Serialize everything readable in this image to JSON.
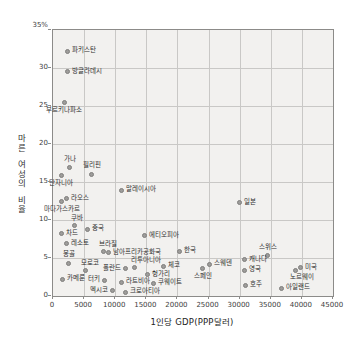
{
  "chart_data": {
    "type": "scatter",
    "title": "",
    "xlabel": "1인당 GDP(PPP달러)",
    "ylabel": "마른 여성의 비율",
    "ylabel_vertical_groups": [
      "마른",
      "여성의",
      "비율"
    ],
    "xlim": [
      0,
      45000
    ],
    "ylim": [
      0,
      35
    ],
    "grid": true,
    "x_grid_step": 5000,
    "y_grid_step": 5,
    "x_ticks": [
      {
        "value": 0,
        "label": "0"
      },
      {
        "value": 5000,
        "label": "5000"
      },
      {
        "value": 10000,
        "label": "10000"
      },
      {
        "value": 15000,
        "label": "15000"
      },
      {
        "value": 20000,
        "label": "20000"
      },
      {
        "value": 25000,
        "label": "25000"
      },
      {
        "value": 30000,
        "label": "30000"
      },
      {
        "value": 35000,
        "label": "35000"
      },
      {
        "value": 40000,
        "label": "40000"
      },
      {
        "value": 45000,
        "label": "45000"
      }
    ],
    "y_ticks": [
      {
        "value": 0,
        "label": "0",
        "dy": 0
      },
      {
        "value": 5,
        "label": "5",
        "dy": 0
      },
      {
        "value": 10,
        "label": "10",
        "dy": 0
      },
      {
        "value": 15,
        "label": "15",
        "dy": 0
      },
      {
        "value": 20,
        "label": "20",
        "dy": 0
      },
      {
        "value": 25,
        "label": "25",
        "dy": 0
      },
      {
        "value": 30,
        "label": "30",
        "dy": 0
      },
      {
        "value": 35,
        "label": "35%",
        "dy": -4
      }
    ],
    "points": [
      {
        "label": "파키스탄",
        "x": 2300,
        "y": 32.2,
        "pos": "right"
      },
      {
        "label": "방글라데시",
        "x": 2300,
        "y": 29.5,
        "pos": "right"
      },
      {
        "label": "부르키나파소",
        "x": 1800,
        "y": 25.4,
        "pos": "below"
      },
      {
        "label": "가나",
        "x": 2700,
        "y": 16.9,
        "pos": "above"
      },
      {
        "label": "필리핀",
        "x": 6200,
        "y": 16.0,
        "pos": "above"
      },
      {
        "label": "탄자니아",
        "x": 1300,
        "y": 15.8,
        "pos": "below"
      },
      {
        "label": "말레이시아",
        "x": 11000,
        "y": 13.9,
        "pos": "right"
      },
      {
        "label": "라오스",
        "x": 2200,
        "y": 12.8,
        "pos": "right"
      },
      {
        "label": "마다가스카르",
        "x": 1400,
        "y": 12.5,
        "pos": "below"
      },
      {
        "label": "일본",
        "x": 30000,
        "y": 12.3,
        "pos": "right"
      },
      {
        "label": "쿠바",
        "x": 3500,
        "y": 9.3,
        "pos": "above-right"
      },
      {
        "label": "중국",
        "x": 5500,
        "y": 8.8,
        "pos": "right"
      },
      {
        "label": "차드",
        "x": 1400,
        "y": 8.2,
        "pos": "right"
      },
      {
        "label": "에티오피아",
        "x": 14700,
        "y": 7.9,
        "pos": "right"
      },
      {
        "label": "레소토",
        "x": 2200,
        "y": 6.9,
        "pos": "right"
      },
      {
        "label": "브라질",
        "x": 8100,
        "y": 5.9,
        "pos": "above-right"
      },
      {
        "label": "남아프리카공화국",
        "x": 8900,
        "y": 5.7,
        "pos": "right"
      },
      {
        "label": "한국",
        "x": 20400,
        "y": 5.9,
        "pos": "right"
      },
      {
        "label": "스위스",
        "x": 34500,
        "y": 5.3,
        "pos": "above"
      },
      {
        "label": "캐나다",
        "x": 30800,
        "y": 4.8,
        "pos": "right"
      },
      {
        "label": "몽골",
        "x": 2500,
        "y": 4.3,
        "pos": "above"
      },
      {
        "label": "스웨덴",
        "x": 25200,
        "y": 4.2,
        "pos": "right"
      },
      {
        "label": "체코",
        "x": 17800,
        "y": 3.9,
        "pos": "right"
      },
      {
        "label": "리투아니아",
        "x": 13100,
        "y": 3.8,
        "pos": "above-right"
      },
      {
        "label": "미국",
        "x": 39800,
        "y": 3.7,
        "pos": "right"
      },
      {
        "label": "폴란드",
        "x": 11600,
        "y": 3.6,
        "pos": "left"
      },
      {
        "label": "스페인",
        "x": 24100,
        "y": 3.6,
        "pos": "below"
      },
      {
        "label": "영국",
        "x": 30700,
        "y": 3.4,
        "pos": "right"
      },
      {
        "label": "모로코",
        "x": 5200,
        "y": 3.4,
        "pos": "above-right"
      },
      {
        "label": "노르웨이",
        "x": 39000,
        "y": 3.3,
        "pos": "below-right"
      },
      {
        "label": "헝가리",
        "x": 15200,
        "y": 2.8,
        "pos": "right"
      },
      {
        "label": "카메룬",
        "x": 1500,
        "y": 2.2,
        "pos": "right"
      },
      {
        "label": "터키",
        "x": 8300,
        "y": 2.1,
        "pos": "left"
      },
      {
        "label": "라트비아",
        "x": 11000,
        "y": 1.8,
        "pos": "right"
      },
      {
        "label": "쿠웨이트",
        "x": 16100,
        "y": 1.7,
        "pos": "right"
      },
      {
        "label": "호주",
        "x": 30900,
        "y": 1.4,
        "pos": "right"
      },
      {
        "label": "아일랜드",
        "x": 36800,
        "y": 1.0,
        "pos": "right"
      },
      {
        "label": "멕시코",
        "x": 9500,
        "y": 0.7,
        "pos": "left"
      },
      {
        "label": "크로아티아",
        "x": 11700,
        "y": 0.5,
        "pos": "right"
      }
    ]
  },
  "colors": {
    "page_bg": "#ffffff",
    "plot_bg": "#f2f1ef",
    "grid": "#c9c8c6",
    "frame": "#8c8b89",
    "dot_fill": "#9d9c9a",
    "dot_border": "#7f7e7c",
    "tick_text": "#3d3d3d",
    "label_text": "#2e2e2e"
  }
}
